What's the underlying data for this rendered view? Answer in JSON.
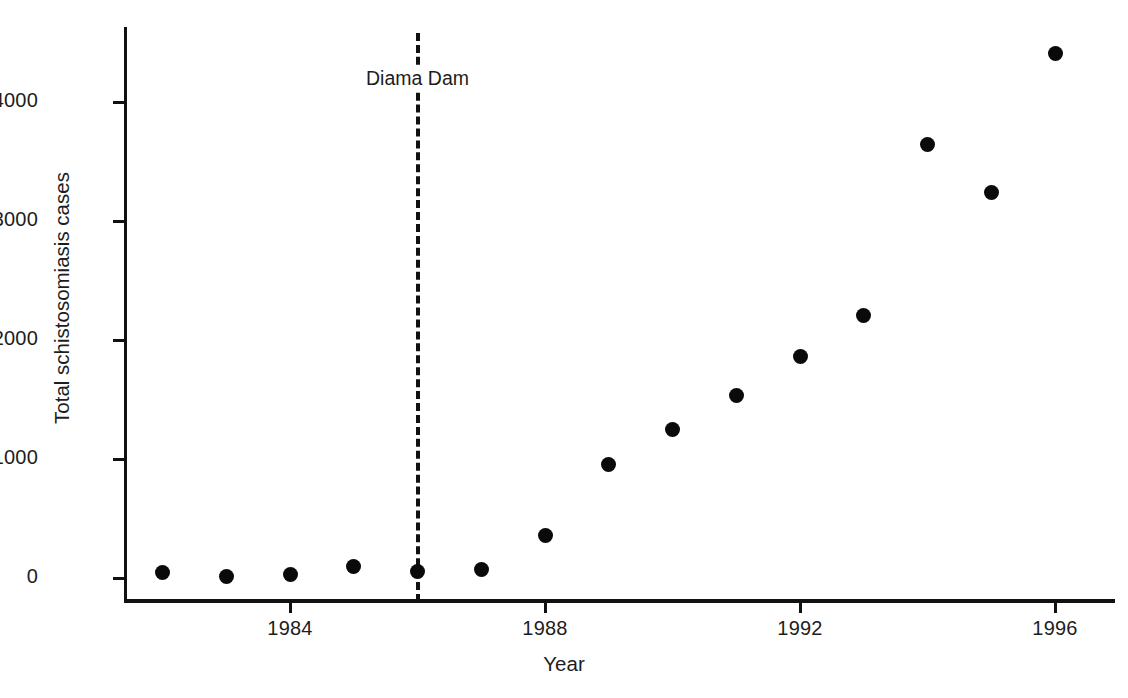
{
  "chart_data": {
    "type": "scatter",
    "title": "",
    "xlabel": "Year",
    "ylabel": "Total schistosomiasis cases",
    "xlim": [
      1981.3,
      1996.7
    ],
    "ylim": [
      -180,
      4760
    ],
    "grid": false,
    "legend": "none",
    "x_ticks": [
      "1984",
      "1988",
      "1992",
      "1996"
    ],
    "x_tick_values": [
      1984,
      1988,
      1992,
      1996
    ],
    "y_ticks": [
      "0",
      "1000",
      "2000",
      "3000",
      "4000"
    ],
    "y_tick_values": [
      0,
      1000,
      2000,
      3000,
      4000
    ],
    "marker": "filled-circle",
    "marker_color": "#0a0a0a",
    "x": [
      1982,
      1983,
      1984,
      1985,
      1986,
      1987,
      1988,
      1989,
      1990,
      1991,
      1992,
      1993,
      1994,
      1995,
      1996
    ],
    "values": [
      45,
      10,
      30,
      100,
      55,
      70,
      355,
      955,
      1250,
      1530,
      1865,
      2210,
      3640,
      3240,
      4410
    ],
    "annotations": [
      {
        "label": "Diama Dam",
        "x": 1986,
        "type": "vertical-dashed-line",
        "color": "#111111",
        "label_y": 4200
      }
    ]
  },
  "axes": {
    "x_title": "Year",
    "y_title": "Total schistosomiasis cases"
  },
  "annotation": {
    "diama_dam_label": "Diama Dam"
  },
  "colors": {
    "marker": "#0a0a0a",
    "axis": "#111111",
    "text": "#1d1d1d",
    "background": "#ffffff"
  }
}
